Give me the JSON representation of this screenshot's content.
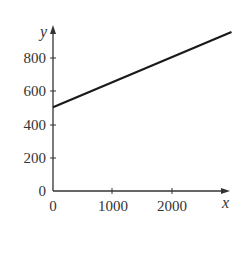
{
  "chart_data": {
    "type": "line",
    "title": "",
    "xlabel": "x",
    "ylabel": "y",
    "xlim": [
      0,
      3000
    ],
    "ylim": [
      0,
      950
    ],
    "grid": false,
    "legend": null,
    "x_ticks": [
      0,
      1000,
      2000
    ],
    "y_ticks": [
      0,
      200,
      400,
      600,
      800
    ],
    "x_tick_labels": [
      "0",
      "1000",
      "2000"
    ],
    "y_tick_labels": [
      "0",
      "200",
      "400",
      "600",
      "800"
    ],
    "series": [
      {
        "name": "y = 500 + 0.15x",
        "x": [
          0,
          3000
        ],
        "y": [
          500,
          950
        ]
      }
    ]
  },
  "labels": {
    "x_axis": "x",
    "y_axis": "y",
    "x_ticks": [
      "0",
      "1000",
      "2000"
    ],
    "y_ticks": [
      "0",
      "200",
      "400",
      "600",
      "800"
    ]
  },
  "colors": {
    "line": "#1a1a1a",
    "axis": "#333333"
  }
}
